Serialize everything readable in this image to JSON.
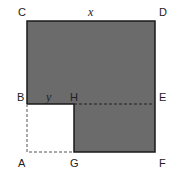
{
  "diagram": {
    "title": "",
    "points": {
      "A": "A",
      "B": "B",
      "C": "C",
      "D": "D",
      "E": "E",
      "F": "F",
      "G": "G",
      "H": "H"
    },
    "variables": {
      "x": "x",
      "y": "y"
    },
    "colors": {
      "shaded": "#6b6b6b",
      "outline": "#1a1a1a",
      "dashed": "#555555",
      "background": "#ffffff"
    }
  }
}
